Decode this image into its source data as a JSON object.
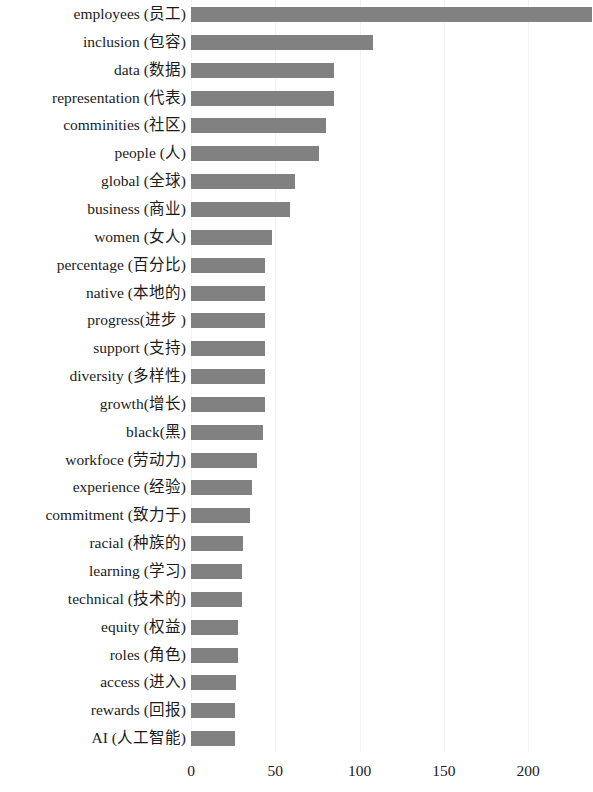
{
  "chart_data": {
    "type": "bar",
    "orientation": "horizontal",
    "title": "",
    "subtitle": "",
    "xlabel": "",
    "ylabel": "",
    "xlim": [
      0,
      240
    ],
    "ylim": null,
    "grid": true,
    "grid_axis": "x",
    "legend": false,
    "legend_position": "none",
    "bar_color": "#818181",
    "background_color": "#ffffff",
    "text_color": "#1b1b1b",
    "xticks": [
      0,
      50,
      100,
      150,
      200
    ],
    "xtick_labels": [
      "0",
      "50",
      "100",
      "150",
      "200"
    ],
    "note": "Top bar (employees) extends beyond the right edge of the plotted canvas.",
    "categories": [
      "employees (员工)",
      "inclusion (包容)",
      "data (数据)",
      "representation (代表)",
      "comminities (社区)",
      "people (人)",
      "global (全球)",
      "business (商业)",
      "women (女人)",
      "percentage (百分比)",
      "native (本地的)",
      "progress(进步 )",
      "support (支持)",
      "diversity (多样性)",
      "growth(增长)",
      "black(黑)",
      "workfoce (劳动力)",
      "experience (经验)",
      "commitment (致力于)",
      "racial (种族的)",
      "learning (学习)",
      "technical (技术的)",
      "equity (权益)",
      "roles (角色)",
      "access (进入)",
      "rewards (回报)",
      "AI (人工智能)"
    ],
    "values": [
      238,
      108,
      85,
      85,
      80,
      76,
      62,
      59,
      48,
      44,
      44,
      44,
      44,
      44,
      44,
      43,
      39,
      36,
      35,
      31,
      30,
      30,
      28,
      28,
      27,
      26,
      26
    ]
  }
}
